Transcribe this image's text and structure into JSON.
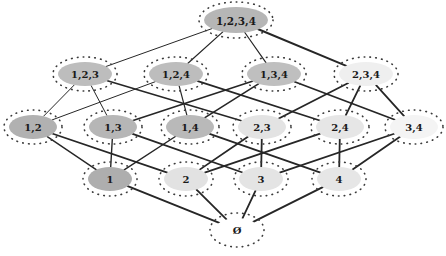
{
  "figure": {
    "kind": "hasse-diagram",
    "background_color": "#ffffff",
    "edge_color": "#262626",
    "node_border_color": "#3b3b3b",
    "label_color": "#1a1a1a"
  },
  "nodes": [
    {
      "id": "1234",
      "label": "1,2,3,4",
      "x": 236,
      "y": 20,
      "rx": 32,
      "ry": 13,
      "fill": "#b6b6b6",
      "rank": 4
    },
    {
      "id": "123",
      "label": "1,2,3",
      "x": 85,
      "y": 74,
      "rx": 27,
      "ry": 12,
      "fill": "#bdbdbd",
      "rank": 3
    },
    {
      "id": "124",
      "label": "1,2,4",
      "x": 176,
      "y": 74,
      "rx": 27,
      "ry": 12,
      "fill": "#bdbdbd",
      "rank": 3
    },
    {
      "id": "134",
      "label": "1,3,4",
      "x": 274,
      "y": 74,
      "rx": 27,
      "ry": 12,
      "fill": "#bfbfbf",
      "rank": 3
    },
    {
      "id": "234",
      "label": "2,3,4",
      "x": 366,
      "y": 74,
      "rx": 27,
      "ry": 12,
      "fill": "#efefef",
      "rank": 3
    },
    {
      "id": "12",
      "label": "1,2",
      "x": 33,
      "y": 127,
      "rx": 24,
      "ry": 12,
      "fill": "#b1b1b1",
      "rank": 2
    },
    {
      "id": "13",
      "label": "1,3",
      "x": 113,
      "y": 127,
      "rx": 24,
      "ry": 12,
      "fill": "#b6b6b6",
      "rank": 2
    },
    {
      "id": "14",
      "label": "1,4",
      "x": 190,
      "y": 127,
      "rx": 24,
      "ry": 12,
      "fill": "#b9b9b9",
      "rank": 2
    },
    {
      "id": "23",
      "label": "2,3",
      "x": 262,
      "y": 127,
      "rx": 24,
      "ry": 12,
      "fill": "#e3e3e3",
      "rank": 2
    },
    {
      "id": "24",
      "label": "2,4",
      "x": 340,
      "y": 127,
      "rx": 24,
      "ry": 12,
      "fill": "#e6e6e6",
      "rank": 2
    },
    {
      "id": "34",
      "label": "3,4",
      "x": 414,
      "y": 127,
      "rx": 24,
      "ry": 12,
      "fill": "#f4f4f4",
      "rank": 2
    },
    {
      "id": "1",
      "label": "1",
      "x": 110,
      "y": 179,
      "rx": 22,
      "ry": 12,
      "fill": "#aeaeae",
      "rank": 1
    },
    {
      "id": "2",
      "label": "2",
      "x": 186,
      "y": 179,
      "rx": 22,
      "ry": 12,
      "fill": "#e2e2e2",
      "rank": 1
    },
    {
      "id": "3",
      "label": "3",
      "x": 261,
      "y": 179,
      "rx": 22,
      "ry": 12,
      "fill": "#e4e4e4",
      "rank": 1
    },
    {
      "id": "4",
      "label": "4",
      "x": 339,
      "y": 179,
      "rx": 22,
      "ry": 12,
      "fill": "#e6e6e6",
      "rank": 1
    },
    {
      "id": "empty",
      "label": "Ø",
      "x": 237,
      "y": 230,
      "rx": 22,
      "ry": 12,
      "fill": "#ffffff",
      "rank": 0
    }
  ],
  "edges": [
    {
      "from": "1234",
      "to": "123",
      "weight": 1.0
    },
    {
      "from": "1234",
      "to": "124",
      "weight": 1.2
    },
    {
      "from": "1234",
      "to": "134",
      "weight": 1.2
    },
    {
      "from": "1234",
      "to": "234",
      "weight": 2.0
    },
    {
      "from": "123",
      "to": "12",
      "weight": 1.0
    },
    {
      "from": "123",
      "to": "13",
      "weight": 1.0
    },
    {
      "from": "123",
      "to": "23",
      "weight": 1.6
    },
    {
      "from": "124",
      "to": "12",
      "weight": 1.0
    },
    {
      "from": "124",
      "to": "14",
      "weight": 1.2
    },
    {
      "from": "124",
      "to": "24",
      "weight": 1.8
    },
    {
      "from": "134",
      "to": "13",
      "weight": 1.6
    },
    {
      "from": "134",
      "to": "14",
      "weight": 1.6
    },
    {
      "from": "134",
      "to": "34",
      "weight": 1.8
    },
    {
      "from": "234",
      "to": "23",
      "weight": 1.8
    },
    {
      "from": "234",
      "to": "24",
      "weight": 1.8
    },
    {
      "from": "234",
      "to": "34",
      "weight": 1.8
    },
    {
      "from": "12",
      "to": "1",
      "weight": 1.4
    },
    {
      "from": "12",
      "to": "2",
      "weight": 1.8
    },
    {
      "from": "13",
      "to": "1",
      "weight": 1.4
    },
    {
      "from": "13",
      "to": "3",
      "weight": 1.8
    },
    {
      "from": "14",
      "to": "1",
      "weight": 1.4
    },
    {
      "from": "14",
      "to": "4",
      "weight": 1.8
    },
    {
      "from": "23",
      "to": "2",
      "weight": 1.8
    },
    {
      "from": "23",
      "to": "3",
      "weight": 1.8
    },
    {
      "from": "24",
      "to": "2",
      "weight": 1.8
    },
    {
      "from": "24",
      "to": "4",
      "weight": 1.8
    },
    {
      "from": "34",
      "to": "3",
      "weight": 1.8
    },
    {
      "from": "34",
      "to": "4",
      "weight": 1.8
    },
    {
      "from": "1",
      "to": "empty",
      "weight": 2.0
    },
    {
      "from": "2",
      "to": "empty",
      "weight": 1.8
    },
    {
      "from": "3",
      "to": "empty",
      "weight": 1.8
    },
    {
      "from": "4",
      "to": "empty",
      "weight": 2.0
    }
  ]
}
